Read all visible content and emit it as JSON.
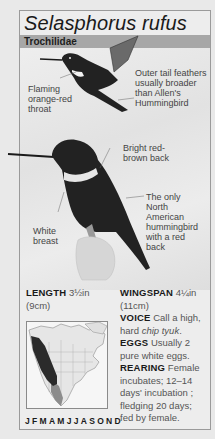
{
  "header": {
    "species_name": "Selasphorus rufus",
    "family": "Trochilidae"
  },
  "illustration_labels": {
    "throat": [
      "Flaming",
      "orange-red",
      "throat"
    ],
    "tail": [
      "Outer tail feathers",
      "usually broader",
      "than Allen's",
      "Hummingbird"
    ],
    "back": [
      "Bright red-",
      "brown back"
    ],
    "breast": [
      "White",
      "breast"
    ],
    "unique": [
      "The only",
      "North",
      "American",
      "hummingbird",
      "with a red",
      "back"
    ]
  },
  "stats": {
    "length_label": "LENGTH",
    "length_value": "3½in",
    "length_metric": "(9cm)",
    "wingspan_label": "WINGSPAN",
    "wingspan_value": "4¼in",
    "wingspan_metric": "(11cm)",
    "voice_label": "VOICE",
    "voice_text_1": "Call a high,",
    "voice_text_2a": "hard ",
    "voice_text_2b": "chip tyuk",
    "voice_text_2c": ".",
    "eggs_label": "EGGS",
    "eggs_text_1": "Usually 2",
    "eggs_text_2": "pure white eggs.",
    "rearing_label": "REARING",
    "rearing_text_1": "Female",
    "rearing_text_2": "incubates; 12–14",
    "rearing_text_3": "days' incubation ;",
    "rearing_text_4": "fledging 20 days;",
    "rearing_text_5": "fed by female."
  },
  "range_map": {
    "months": "JFMAMJJASOND",
    "range_color": "#2b2b2b",
    "winter_color": "#8c8c8c"
  }
}
